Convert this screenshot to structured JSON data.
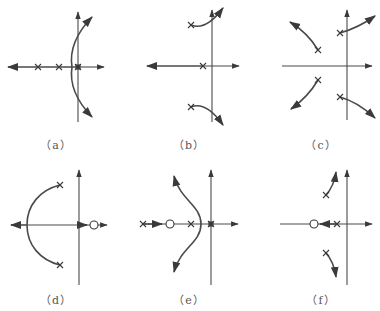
{
  "figure": {
    "panels": [
      {
        "id": "a",
        "label": "（a）",
        "poles": 3,
        "zeros": 0,
        "description": "three real poles; two branches cross the imaginary axis"
      },
      {
        "id": "b",
        "label": "（b）",
        "poles": 3,
        "zeros": 0,
        "description": "one real pole, complex pair branching to right half plane"
      },
      {
        "id": "c",
        "label": "（c）",
        "poles": 4,
        "zeros": 0,
        "description": "two complex pole pairs, asymptotic branches"
      },
      {
        "id": "d",
        "label": "（d）",
        "poles": 2,
        "zeros": 1,
        "description": "complex pole pair with circular arc to real axis, zero in right half plane"
      },
      {
        "id": "e",
        "label": "（e）",
        "poles": 3,
        "zeros": 1,
        "description": "three real poles and one zero, S-shaped branches"
      },
      {
        "id": "f",
        "label": "（f）",
        "poles": 3,
        "zeros": 1,
        "description": "complex pair and real pole, real pole moves toward zero"
      }
    ]
  },
  "colors": {
    "line": "#4a4a4a",
    "marker": "#3a3a3a",
    "label": "#555555"
  }
}
